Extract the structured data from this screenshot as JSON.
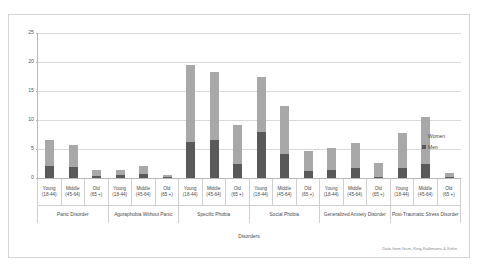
{
  "legend": {
    "position": "right",
    "items": [
      {
        "label": "Women",
        "color": "#a8a8a8"
      },
      {
        "label": "Men",
        "color": "#595959"
      }
    ]
  },
  "source_note": "Data from Gum, King-Kallimanis & Kohn",
  "axis": {
    "x_title": "Disorders",
    "y_ticks": [
      "0",
      "5",
      "10",
      "15",
      "20",
      "25"
    ]
  },
  "chart_data": {
    "type": "bar",
    "title": "",
    "subtitle": "",
    "xlabel": "Disorders",
    "ylabel": "",
    "ylim": [
      0,
      25
    ],
    "ytick_values": [
      0,
      5,
      10,
      15,
      20,
      25
    ],
    "grid": true,
    "stacked": true,
    "legend_position": "right",
    "age_labels": [
      "Young (18-44)",
      "Middle (45-64)",
      "Old (65 +)"
    ],
    "groups": [
      "Panic Disorder",
      "Agoraphobia Without Panic",
      "Specific Phobia",
      "Social Phobia",
      "Generalized Anxiety Disorder",
      "Post-Traumatic Stress Disorder"
    ],
    "categories": [
      "Panic Disorder / Young (18-44)",
      "Panic Disorder / Middle (45-64)",
      "Panic Disorder / Old (65 +)",
      "Agoraphobia Without Panic / Young (18-44)",
      "Agoraphobia Without Panic / Middle (45-64)",
      "Agoraphobia Without Panic / Old (65 +)",
      "Specific Phobia / Young (18-44)",
      "Specific Phobia / Middle (45-64)",
      "Specific Phobia / Old (65 +)",
      "Social Phobia / Young (18-44)",
      "Social Phobia / Middle (45-64)",
      "Social Phobia / Old (65 +)",
      "Generalized Anxiety Disorder / Young (18-44)",
      "Generalized Anxiety Disorder / Middle (45-64)",
      "Generalized Anxiety Disorder / Old (65 +)",
      "Post-Traumatic Stress Disorder / Young (18-44)",
      "Post-Traumatic Stress Disorder / Middle (45-64)",
      "Post-Traumatic Stress Disorder / Old (65 +)"
    ],
    "series": [
      {
        "name": "Men",
        "color": "#595959",
        "values": [
          2.1,
          1.9,
          0.4,
          0.5,
          0.7,
          0.2,
          6.2,
          6.5,
          2.5,
          7.9,
          4.2,
          1.2,
          1.3,
          1.7,
          0.1,
          1.7,
          2.5,
          0.2
        ]
      },
      {
        "name": "Women",
        "color": "#a8a8a8",
        "values": [
          4.5,
          3.8,
          1.0,
          0.9,
          1.3,
          0.3,
          13.3,
          11.8,
          6.7,
          9.5,
          8.2,
          3.5,
          3.9,
          4.3,
          2.5,
          6.1,
          8.0,
          0.6
        ]
      }
    ],
    "totals": [
      6.6,
      5.7,
      1.4,
      1.4,
      2.0,
      0.5,
      19.5,
      18.3,
      9.2,
      17.4,
      12.4,
      4.7,
      5.2,
      6.0,
      2.6,
      7.8,
      10.5,
      0.8
    ],
    "bars": [
      {
        "group": "Panic Disorder",
        "age": "Young (18-44)",
        "men": 2.1,
        "women": 4.5,
        "total": 6.6
      },
      {
        "group": "Panic Disorder",
        "age": "Middle (45-64)",
        "men": 1.9,
        "women": 3.8,
        "total": 5.7
      },
      {
        "group": "Panic Disorder",
        "age": "Old (65 +)",
        "men": 0.4,
        "women": 1.0,
        "total": 1.4
      },
      {
        "group": "Agoraphobia Without Panic",
        "age": "Young (18-44)",
        "men": 0.5,
        "women": 0.9,
        "total": 1.4
      },
      {
        "group": "Agoraphobia Without Panic",
        "age": "Middle (45-64)",
        "men": 0.7,
        "women": 1.3,
        "total": 2.0
      },
      {
        "group": "Agoraphobia Without Panic",
        "age": "Old (65 +)",
        "men": 0.2,
        "women": 0.3,
        "total": 0.5
      },
      {
        "group": "Specific Phobia",
        "age": "Young (18-44)",
        "men": 6.2,
        "women": 13.3,
        "total": 19.5
      },
      {
        "group": "Specific Phobia",
        "age": "Middle (45-64)",
        "men": 6.5,
        "women": 11.8,
        "total": 18.3
      },
      {
        "group": "Specific Phobia",
        "age": "Old (65 +)",
        "men": 2.5,
        "women": 6.7,
        "total": 9.2
      },
      {
        "group": "Social Phobia",
        "age": "Young (18-44)",
        "men": 7.9,
        "women": 9.5,
        "total": 17.4
      },
      {
        "group": "Social Phobia",
        "age": "Middle (45-64)",
        "men": 4.2,
        "women": 8.2,
        "total": 12.4
      },
      {
        "group": "Social Phobia",
        "age": "Old (65 +)",
        "men": 1.2,
        "women": 3.5,
        "total": 4.7
      },
      {
        "group": "Generalized Anxiety Disorder",
        "age": "Young (18-44)",
        "men": 1.3,
        "women": 3.9,
        "total": 5.2
      },
      {
        "group": "Generalized Anxiety Disorder",
        "age": "Middle (45-64)",
        "men": 1.7,
        "women": 4.3,
        "total": 6.0
      },
      {
        "group": "Generalized Anxiety Disorder",
        "age": "Old (65 +)",
        "men": 0.1,
        "women": 2.5,
        "total": 2.6
      },
      {
        "group": "Post-Traumatic Stress Disorder",
        "age": "Young (18-44)",
        "men": 1.7,
        "women": 6.1,
        "total": 7.8
      },
      {
        "group": "Post-Traumatic Stress Disorder",
        "age": "Middle (45-64)",
        "men": 2.5,
        "women": 8.0,
        "total": 10.5
      },
      {
        "group": "Post-Traumatic Stress Disorder",
        "age": "Old (65 +)",
        "men": 0.2,
        "women": 0.6,
        "total": 0.8
      }
    ]
  }
}
